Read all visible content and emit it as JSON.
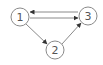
{
  "diagram": {
    "type": "directed-graph",
    "colors": {
      "stroke": "#8a8a8a",
      "label": "#555555",
      "background": "#ffffff"
    },
    "nodes": [
      {
        "id": "1",
        "label": "1",
        "x": 20,
        "y": 17,
        "r": 9
      },
      {
        "id": "2",
        "label": "2",
        "x": 55,
        "y": 50,
        "r": 9
      },
      {
        "id": "3",
        "label": "3",
        "x": 88,
        "y": 16,
        "r": 9
      }
    ],
    "edges": [
      {
        "from": "3",
        "to": "1"
      },
      {
        "from": "1",
        "to": "3"
      },
      {
        "from": "1",
        "to": "2"
      },
      {
        "from": "2",
        "to": "3"
      }
    ]
  }
}
